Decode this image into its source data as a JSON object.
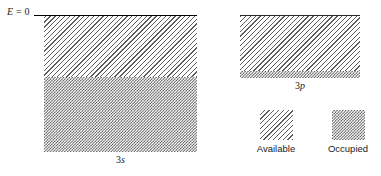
{
  "figure": {
    "axis": {
      "zero_level_label_symbol": "E",
      "zero_level_label_rest": " = 0"
    },
    "bands": [
      {
        "id": "3s",
        "label_number": "3",
        "label_orbital": "s",
        "regions": [
          {
            "state": "available",
            "fill": "diagonal-hatch"
          },
          {
            "state": "occupied",
            "fill": "checkerboard"
          }
        ]
      },
      {
        "id": "3p",
        "label_number": "3",
        "label_orbital": "p",
        "regions": [
          {
            "state": "available",
            "fill": "diagonal-hatch"
          },
          {
            "state": "occupied",
            "fill": "checkerboard"
          }
        ]
      }
    ],
    "legend": {
      "items": [
        {
          "key": "available",
          "label": "Available",
          "fill": "diagonal-hatch"
        },
        {
          "key": "occupied",
          "label": "Occupied",
          "fill": "checkerboard"
        }
      ]
    },
    "colors": {
      "background": "#ffffff",
      "ink": "#1a1a1a",
      "hatch": "#5d5d5d",
      "checker": "#4f4f4f",
      "zero_line": "#000000"
    }
  }
}
